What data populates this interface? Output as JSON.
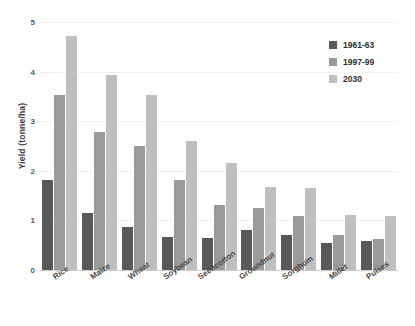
{
  "chart_data": {
    "type": "bar",
    "title": "",
    "xlabel": "",
    "ylabel": "Yield (tonne/ha)",
    "ylim": [
      0,
      5
    ],
    "yticks": [
      0,
      1,
      2,
      3,
      4,
      5
    ],
    "ytick_labels": [
      "0",
      "1",
      "2",
      "3",
      "4",
      "5"
    ],
    "grid": true,
    "legend_position": "top-right",
    "categories": [
      "Rice",
      "Maize",
      "Wheat",
      "Soybean",
      "Seedcotton",
      "Groundnut",
      "Sorghum",
      "Millet",
      "Pulses"
    ],
    "series": [
      {
        "name": "1961-63",
        "color": "#595959",
        "values": [
          1.81,
          1.15,
          0.86,
          0.67,
          0.65,
          0.8,
          0.7,
          0.55,
          0.58
        ]
      },
      {
        "name": "1997-99",
        "color": "#9a9a9a",
        "values": [
          3.53,
          2.78,
          2.5,
          1.82,
          1.32,
          1.25,
          1.08,
          0.7,
          0.63
        ]
      },
      {
        "name": "2030",
        "color": "#bfbfbf",
        "values": [
          4.71,
          3.93,
          3.52,
          2.61,
          2.15,
          1.68,
          1.65,
          1.1,
          1.08
        ]
      }
    ]
  },
  "colors": {
    "series_1961_63": "#595959",
    "series_1997_99": "#9a9a9a",
    "series_2030": "#bfbfbf",
    "gridline": "#f2f2f2",
    "axis": "#cccccc",
    "background": "#ffffff"
  }
}
